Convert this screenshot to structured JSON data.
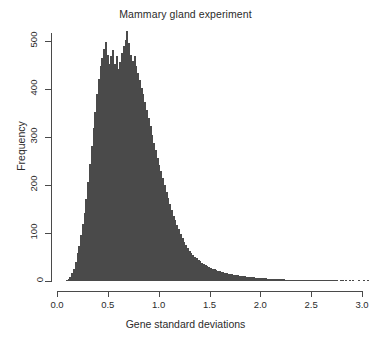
{
  "chart_data": {
    "type": "bar",
    "title": "Mammary gland experiment",
    "xlabel": "Gene standard deviations",
    "ylabel": "Frequency",
    "xlim": [
      0.0,
      3.0
    ],
    "ylim": [
      0,
      520
    ],
    "xticks": [
      "0.0",
      "0.5",
      "1.0",
      "1.5",
      "2.0",
      "2.5",
      "3.0"
    ],
    "xtick_values": [
      0.0,
      0.5,
      1.0,
      1.5,
      2.0,
      2.5,
      3.0
    ],
    "yticks": [
      "0",
      "100",
      "200",
      "300",
      "400",
      "500"
    ],
    "ytick_values": [
      0,
      100,
      200,
      300,
      400,
      500
    ],
    "grid": false,
    "legend": null,
    "bin_width": 0.0175,
    "bin_start": 0.0,
    "bar_fill_color": "#c9c9c9",
    "bar_border_color": "#4a4a4a",
    "axis_color": "#4a4a4a",
    "values": [
      0,
      0,
      0,
      0,
      0,
      2,
      4,
      9,
      16,
      26,
      40,
      58,
      72,
      96,
      118,
      142,
      171,
      205,
      243,
      280,
      318,
      352,
      389,
      420,
      447,
      463,
      482,
      497,
      470,
      452,
      468,
      481,
      452,
      468,
      440,
      455,
      475,
      488,
      502,
      519,
      496,
      470,
      458,
      468,
      447,
      432,
      418,
      402,
      388,
      372,
      356,
      340,
      322,
      304,
      288,
      272,
      256,
      242,
      228,
      214,
      200,
      186,
      172,
      160,
      148,
      136,
      126,
      116,
      108,
      98,
      90,
      82,
      74,
      68,
      62,
      58,
      54,
      50,
      47,
      44,
      41,
      38,
      35,
      33,
      31,
      29,
      27,
      25,
      24,
      22,
      21,
      20,
      19,
      18,
      17,
      16,
      15,
      14,
      14,
      13,
      12,
      12,
      11,
      11,
      10,
      10,
      9,
      9,
      8,
      8,
      8,
      7,
      7,
      7,
      6,
      6,
      6,
      6,
      5,
      5,
      5,
      5,
      5,
      4,
      4,
      4,
      4,
      4,
      3,
      3,
      3,
      3,
      3,
      3,
      3,
      2,
      2,
      2,
      2,
      2,
      2,
      2,
      2,
      2,
      2,
      1,
      1,
      1,
      1,
      1,
      1,
      1,
      1,
      1,
      1,
      1,
      1,
      1,
      0,
      1,
      1,
      0,
      1,
      0,
      1,
      0,
      1,
      0,
      0,
      1,
      0,
      0,
      1,
      0,
      1
    ]
  }
}
